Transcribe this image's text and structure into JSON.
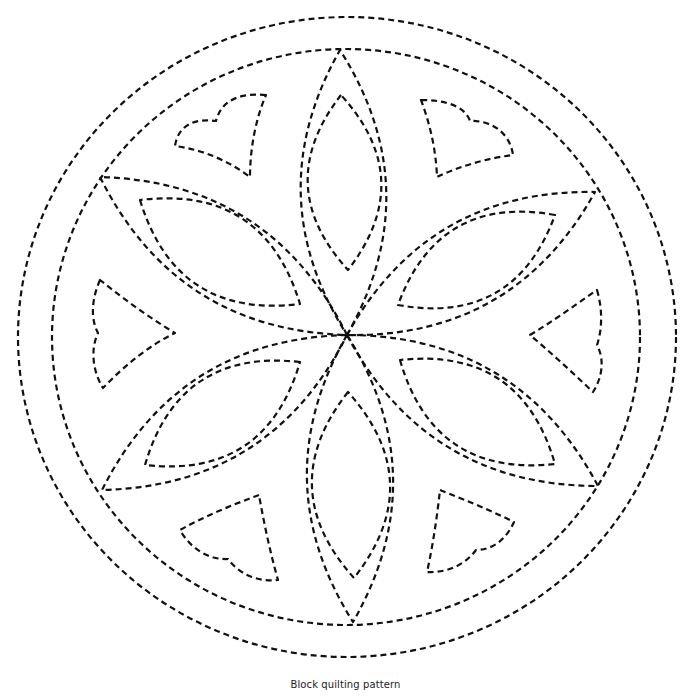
{
  "caption": "Block quilting pattern",
  "style": {
    "stroke_color": "#111111",
    "background": "#ffffff",
    "line_style": "dashed"
  },
  "pattern": {
    "center": [
      347,
      335
    ],
    "outer_circle": {
      "cx": 347,
      "cy": 337,
      "rx": 329,
      "ry": 320
    },
    "inner_circle": {
      "cx": 346,
      "cy": 337,
      "rx": 294,
      "ry": 288
    },
    "petals": [
      {
        "name": "petal-top",
        "tip": [
          340,
          50
        ],
        "bulge": 0.3
      },
      {
        "name": "petal-upper-right",
        "tip": [
          595,
          192
        ],
        "bulge": 0.3
      },
      {
        "name": "petal-lower-right",
        "tip": [
          598,
          486
        ],
        "bulge": 0.3
      },
      {
        "name": "petal-bottom",
        "tip": [
          353,
          622
        ],
        "bulge": 0.3
      },
      {
        "name": "petal-lower-left",
        "tip": [
          102,
          490
        ],
        "bulge": 0.3
      },
      {
        "name": "petal-upper-left",
        "tip": [
          100,
          177
        ],
        "bulge": 0.3
      }
    ],
    "inner_lenses": [
      {
        "name": "lens-top",
        "a": [
          341,
          95
        ],
        "b": [
          348,
          270
        ],
        "bulge": 0.42
      },
      {
        "name": "lens-upper-right",
        "a": [
          555,
          215
        ],
        "b": [
          398,
          305
        ],
        "bulge": 0.42
      },
      {
        "name": "lens-lower-right",
        "a": [
          400,
          360
        ],
        "b": [
          555,
          464
        ],
        "bulge": 0.42
      },
      {
        "name": "lens-bottom",
        "a": [
          348,
          392
        ],
        "b": [
          354,
          578
        ],
        "bulge": 0.42
      },
      {
        "name": "lens-lower-left",
        "a": [
          300,
          362
        ],
        "b": [
          145,
          465
        ],
        "bulge": 0.42
      },
      {
        "name": "lens-upper-left",
        "a": [
          140,
          200
        ],
        "b": [
          300,
          304
        ],
        "bulge": 0.42
      }
    ],
    "hearts": [
      {
        "name": "heart-upper-left",
        "d": "M266,95 C245,93 222,97 216,121 C195,118 178,125 175,146 C205,150 230,162 250,177 C250,148 256,118 266,95 Z"
      },
      {
        "name": "heart-upper-right",
        "d": "M421,100 C445,100 465,106 470,121 C490,120 510,132 513,155 C488,158 460,166 437,177 C436,150 430,124 421,100 Z"
      },
      {
        "name": "heart-left",
        "d": "M100,280 C92,298 90,318 98,333 C90,350 93,372 103,388 C125,365 150,345 175,333 C150,318 125,300 100,280 Z"
      },
      {
        "name": "heart-right",
        "d": "M597,290 C602,307 603,327 597,345 C605,360 602,378 593,392 C572,372 550,352 530,335 C552,322 575,305 597,290 Z"
      },
      {
        "name": "heart-lower-left",
        "d": "M259,495 C232,505 205,516 180,530 C190,548 208,560 228,559 C240,575 258,582 278,580 C270,552 264,523 259,495 Z"
      },
      {
        "name": "heart-lower-right",
        "d": "M440,490 C465,500 490,510 514,522 C506,540 492,550 476,550 C465,565 447,573 427,572 C433,545 437,517 440,490 Z"
      }
    ]
  }
}
